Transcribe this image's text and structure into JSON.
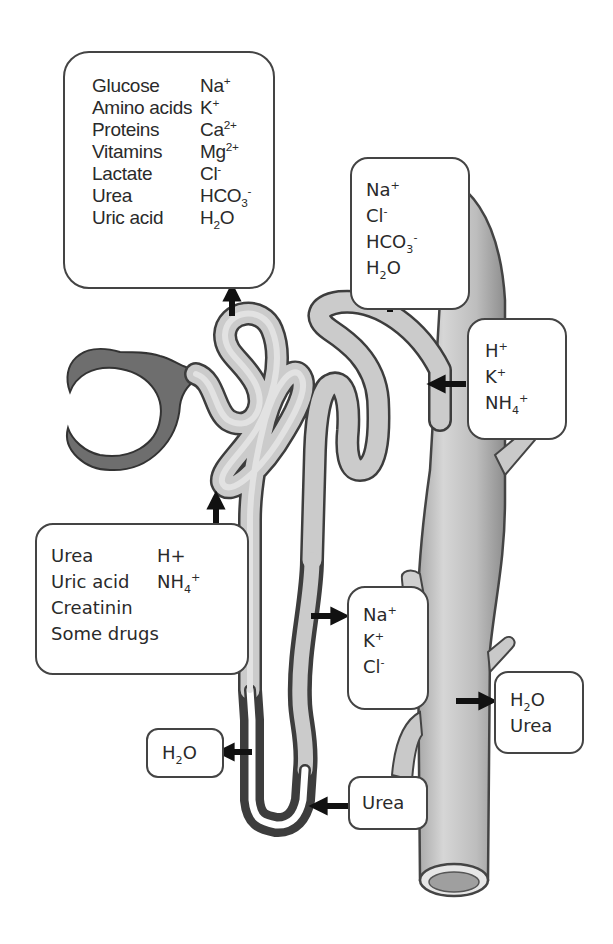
{
  "diagram": {
    "colors": {
      "tubule_fill": "#c8c8c8",
      "tubule_outline": "#4a4a4a",
      "capsule_fill": "#6e6e6e",
      "vessel_fill": "#bdbdbd",
      "arrow": "#111111",
      "box_border": "#444444",
      "text": "#2a2a2a"
    },
    "boxes": {
      "proximal_reabsorption": {
        "left_column": [
          "Glucose",
          "Amino acids",
          "Proteins",
          "Vitamins",
          "Lactate",
          "Urea",
          "Uric acid"
        ],
        "right_column": [
          {
            "base": "Na",
            "sup": "+",
            "sub": ""
          },
          {
            "base": "K",
            "sup": "+",
            "sub": ""
          },
          {
            "base": "Ca",
            "sup": "2+",
            "sub": ""
          },
          {
            "base": "Mg",
            "sup": "2+",
            "sub": ""
          },
          {
            "base": "Cl",
            "sup": "-",
            "sub": ""
          },
          {
            "base": "HCO",
            "sub": "3",
            "sup": "-"
          },
          {
            "base": "H",
            "sub": "2",
            "tail": "O",
            "sup": ""
          }
        ],
        "arrow_direction": "up"
      },
      "distal_reabsorption": {
        "items": [
          {
            "base": "Na",
            "sup": "+"
          },
          {
            "base": "Cl",
            "sup": "-"
          },
          {
            "base": "HCO",
            "sub": "3",
            "sup": "-"
          },
          {
            "base": "H",
            "sub": "2",
            "tail": "O"
          }
        ],
        "arrow_direction": "up"
      },
      "distal_secretion": {
        "items": [
          {
            "base": "H",
            "sup": "+"
          },
          {
            "base": "K",
            "sup": "+"
          },
          {
            "base": "NH",
            "sub": "4",
            "sup": "+"
          }
        ],
        "arrow_direction": "left"
      },
      "proximal_secretion": {
        "left_column": [
          "Urea",
          "Uric acid",
          "Creatinin",
          "Some drugs"
        ],
        "right_column": [
          {
            "base": "H+",
            "sup": ""
          },
          {
            "base": "NH",
            "sub": "4",
            "sup": "+"
          }
        ],
        "arrow_direction": "up"
      },
      "ascending_limb_reabsorption": {
        "items": [
          {
            "base": "Na",
            "sup": "+"
          },
          {
            "base": "K",
            "sup": "+"
          },
          {
            "base": "Cl",
            "sup": "-"
          }
        ],
        "arrow_direction": "right"
      },
      "descending_limb_water": {
        "items": [
          {
            "base": "H",
            "sub": "2",
            "tail": "O"
          }
        ],
        "arrow_direction": "left"
      },
      "loop_urea": {
        "items": [
          {
            "base": "Urea"
          }
        ],
        "arrow_direction": "left"
      },
      "collecting_duct_reabsorption": {
        "items": [
          {
            "base": "H",
            "sub": "2",
            "tail": "O"
          },
          {
            "base": "Urea"
          }
        ],
        "arrow_direction": "right"
      }
    }
  }
}
